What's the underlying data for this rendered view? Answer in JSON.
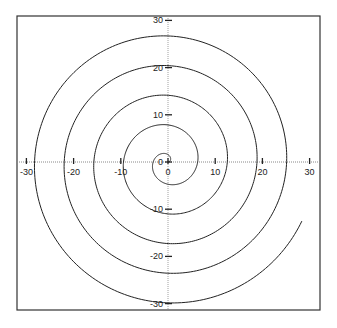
{
  "chart_data": {
    "type": "line",
    "title": "",
    "subtitle": "",
    "xlabel": "",
    "ylabel": "",
    "equation": "r = theta",
    "theta_range": [
      0,
      31
    ],
    "xlim": [
      -32,
      32
    ],
    "ylim": [
      -31.5,
      30.5
    ],
    "grid": false,
    "axes_through_origin": true,
    "axis_style": "dotted",
    "legend": null,
    "x_ticks": [
      -30,
      -20,
      -10,
      0,
      10,
      20,
      30
    ],
    "x_tick_labels": [
      "-30",
      "-20",
      "-10",
      "0",
      "10",
      "20",
      "30"
    ],
    "y_ticks": [
      -30,
      -20,
      -10,
      0,
      10,
      20,
      30
    ],
    "y_tick_labels": [
      "-30",
      "-20",
      "-10",
      "0",
      "10",
      "20",
      "30"
    ],
    "series": [
      {
        "name": "spiral",
        "color": "#222222",
        "axis_crossings": {
          "positive_x": [
            6.3,
            12.6,
            18.8,
            25.1
          ],
          "positive_y": [
            7.9,
            14.1,
            20.4,
            26.7
          ],
          "negative_x": [
            -9.4,
            -15.7,
            -22.0,
            -28.3
          ],
          "negative_y": [
            -11.0,
            -17.3,
            -23.6,
            -29.8
          ]
        },
        "end_point": [
          30.8,
          -3.5
        ]
      }
    ]
  },
  "colors": {
    "background": "#ffffff",
    "frame": "#333333",
    "curve": "#222222",
    "axis": "#888888"
  }
}
